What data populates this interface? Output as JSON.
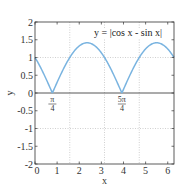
{
  "chart_data": {
    "type": "line",
    "title": "y = |cos x - sin x|",
    "xlabel": "x",
    "ylabel": "y",
    "xlim": [
      0,
      6.283
    ],
    "ylim": [
      -2,
      2
    ],
    "xticks": [
      0,
      1,
      2,
      3,
      4,
      5,
      6
    ],
    "xtick_labels": [
      "0",
      "1",
      "2",
      "3",
      "4",
      "5",
      "6"
    ],
    "yticks": [
      -2,
      -1.5,
      -1,
      -0.5,
      0,
      0.5,
      1,
      1.5,
      2
    ],
    "ytick_labels": [
      "-2",
      "-1.5",
      "-1",
      "-0.5",
      "0",
      "0.5",
      "1",
      "1.5",
      "2"
    ],
    "grid": {
      "vertical_dotted_at": [
        1.5708,
        3.1416,
        4.7124
      ],
      "horizontal_dotted_at": [
        1,
        -1
      ],
      "zero_line": true
    },
    "series": [
      {
        "name": "y = |cos x - sin x|",
        "color": "#7ab4e0",
        "function": "abs(cos(x) - sin(x))",
        "x": [
          0,
          0.3927,
          0.7854,
          1.1781,
          1.5708,
          1.9635,
          2.3562,
          2.7489,
          3.1416,
          3.5343,
          3.927,
          4.3197,
          4.7124,
          5.1051,
          5.4978,
          5.8905,
          6.2832
        ],
        "values": [
          1,
          0.541,
          0,
          0.541,
          1,
          1.307,
          1.414,
          1.307,
          1,
          0.541,
          0,
          0.541,
          1,
          1.307,
          1.414,
          1.307,
          1
        ]
      }
    ],
    "annotations": [
      {
        "x": 0.7854,
        "numerator": "π",
        "denominator": "4"
      },
      {
        "x": 3.927,
        "numerator": "5π",
        "denominator": "4"
      }
    ]
  }
}
